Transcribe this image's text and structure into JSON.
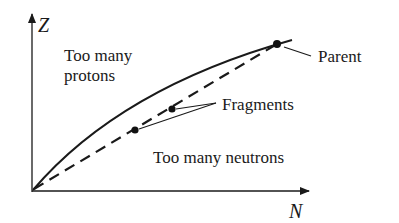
{
  "diagram": {
    "axes": {
      "y_label": "Z",
      "x_label": "N"
    },
    "regions": {
      "upper_line1": "Too many",
      "upper_line2": "protons",
      "lower": "Too many neutrons"
    },
    "labels": {
      "parent": "Parent",
      "fragments": "Fragments"
    },
    "curves": [
      {
        "name": "stability-line",
        "style": "solid"
      },
      {
        "name": "n-z-ratio-line",
        "style": "dashed"
      }
    ],
    "points": [
      {
        "name": "parent",
        "x": 277,
        "y": 44
      },
      {
        "name": "fragment-1",
        "x": 172,
        "y": 109
      },
      {
        "name": "fragment-2",
        "x": 135,
        "y": 130
      }
    ],
    "colors": {
      "ink": "#1a1a1a",
      "background": "#ffffff"
    }
  }
}
